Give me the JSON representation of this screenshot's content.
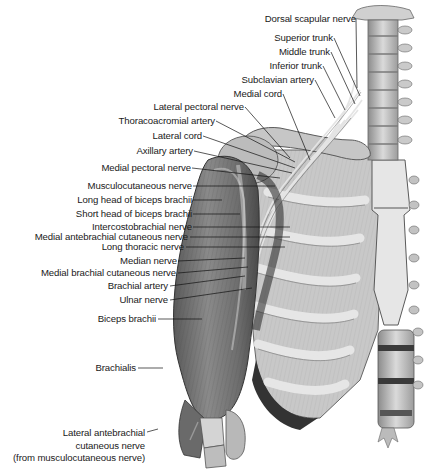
{
  "figure": {
    "labels": [
      {
        "id": "dorsal-scapular-nerve",
        "text": "Dorsal scapular nerve",
        "x": 356,
        "y": 13,
        "lx": 356,
        "ly": 19,
        "tx": 357,
        "ty": 88
      },
      {
        "id": "superior-trunk",
        "text": "Superior trunk",
        "x": 333,
        "y": 32,
        "lx": 334,
        "ly": 38,
        "tx": 360,
        "ty": 96
      },
      {
        "id": "middle-trunk",
        "text": "Middle trunk",
        "x": 330,
        "y": 46,
        "lx": 331,
        "ly": 52,
        "tx": 355,
        "ty": 104
      },
      {
        "id": "inferior-trunk",
        "text": "Inferior trunk",
        "x": 322,
        "y": 60,
        "lx": 323,
        "ly": 66,
        "tx": 345,
        "ty": 110
      },
      {
        "id": "subclavian-artery",
        "text": "Subclavian artery",
        "x": 314,
        "y": 74,
        "lx": 315,
        "ly": 80,
        "tx": 335,
        "ty": 118
      },
      {
        "id": "medial-cord",
        "text": "Medial cord",
        "x": 282,
        "y": 88,
        "lx": 283,
        "ly": 94,
        "tx": 310,
        "ty": 160
      },
      {
        "id": "lateral-pectoral-nerve",
        "text": "Lateral pectoral nerve",
        "x": 244,
        "y": 101,
        "lx": 245,
        "ly": 107,
        "tx": 290,
        "ty": 158
      },
      {
        "id": "thoracoacromial-artery",
        "text": "Thoracoacromial artery",
        "x": 215,
        "y": 115,
        "lx": 216,
        "ly": 121,
        "tx": 295,
        "ty": 162
      },
      {
        "id": "lateral-cord",
        "text": "Lateral cord",
        "x": 202,
        "y": 130,
        "lx": 203,
        "ly": 136,
        "tx": 295,
        "ty": 168
      },
      {
        "id": "axillary-artery",
        "text": "Axillary artery",
        "x": 193,
        "y": 145,
        "lx": 194,
        "ly": 151,
        "tx": 292,
        "ty": 173
      },
      {
        "id": "medial-pectoral-nerve",
        "text": "Medial pectoral nerve",
        "x": 191,
        "y": 162,
        "lx": 192,
        "ly": 168,
        "tx": 280,
        "ty": 178
      },
      {
        "id": "musculocutaneous-nerve",
        "text": "Musculocutaneous nerve",
        "x": 192,
        "y": 180,
        "lx": 193,
        "ly": 186,
        "tx": 275,
        "ty": 186
      },
      {
        "id": "long-head-of-biceps-brachii",
        "text": "Long head of biceps brachii",
        "x": 192,
        "y": 194,
        "lx": 193,
        "ly": 200,
        "tx": 222,
        "ty": 200
      },
      {
        "id": "short-head-of-biceps-brachii",
        "text": "Short head of biceps brachii",
        "x": 192,
        "y": 208,
        "lx": 193,
        "ly": 214,
        "tx": 240,
        "ty": 214
      },
      {
        "id": "intercostobrachial-nerve",
        "text": "Intercostobrachial nerve",
        "x": 192,
        "y": 221,
        "lx": 193,
        "ly": 227,
        "tx": 290,
        "ty": 227
      },
      {
        "id": "medial-antebrachial-cutaneous-nerve",
        "text": "Medial antebrachial cutaneous nerve",
        "x": 188,
        "y": 231,
        "lx": 190,
        "ly": 237,
        "tx": 290,
        "ty": 237
      },
      {
        "id": "long-thoracic-nerve",
        "text": "Long thoracic nerve",
        "x": 184,
        "y": 241,
        "lx": 186,
        "ly": 247,
        "tx": 285,
        "ty": 247
      },
      {
        "id": "median-nerve",
        "text": "Median nerve",
        "x": 177,
        "y": 255,
        "lx": 178,
        "ly": 261,
        "tx": 245,
        "ty": 258
      },
      {
        "id": "medial-brachial-cutaneous-nerve",
        "text": "Medial brachial cutaneous nerve",
        "x": 176,
        "y": 267,
        "lx": 178,
        "ly": 273,
        "tx": 248,
        "ty": 267
      },
      {
        "id": "brachial-artery",
        "text": "Brachial artery",
        "x": 168,
        "y": 280,
        "lx": 170,
        "ly": 286,
        "tx": 245,
        "ty": 276
      },
      {
        "id": "ulnar-nerve",
        "text": "Ulnar nerve",
        "x": 168,
        "y": 294,
        "lx": 170,
        "ly": 300,
        "tx": 252,
        "ty": 288
      },
      {
        "id": "biceps-brachii",
        "text": "Biceps brachii",
        "x": 156,
        "y": 313,
        "lx": 158,
        "ly": 319,
        "tx": 202,
        "ty": 319
      },
      {
        "id": "brachialis",
        "text": "Brachialis",
        "x": 136,
        "y": 362,
        "lx": 138,
        "ly": 368,
        "tx": 163,
        "ty": 368
      },
      {
        "id": "lateral-antebrachial-cutaneous-nerve",
        "text": "Lateral antebrachial",
        "x": 145,
        "y": 427,
        "lx": 147,
        "ly": 432,
        "tx": 158,
        "ty": 429
      }
    ],
    "multiline_label": {
      "id": "lateral-antebrachial-cutaneous-nerve-cont",
      "lines": [
        "cutaneous nerve",
        "(from musculocutaneous nerve)"
      ],
      "x": 145,
      "y": 440
    }
  }
}
